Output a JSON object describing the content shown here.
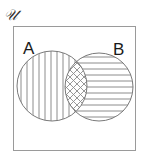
{
  "diagram": {
    "type": "venn",
    "universe_label": "𝒰",
    "sets": [
      {
        "id": "A",
        "label": "A",
        "fill_pattern": "vertical-lines"
      },
      {
        "id": "B",
        "label": "B",
        "fill_pattern": "horizontal-lines"
      }
    ],
    "intersection": {
      "sets": [
        "A",
        "B"
      ],
      "fill_pattern": "diagonal-crosshatch"
    },
    "colors": {
      "outline": "#8a8a8a",
      "hatch": "#8c8c8c",
      "label": "#1a1a1a",
      "background": "#ffffff"
    }
  }
}
